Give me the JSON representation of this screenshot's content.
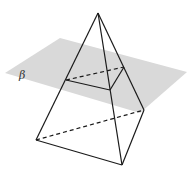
{
  "diagram": {
    "type": "geometry",
    "plane": {
      "label": "β",
      "color": "#d9d9d9",
      "polygon": [
        [
          5,
          73
        ],
        [
          60,
          38
        ],
        [
          187,
          72
        ],
        [
          140,
          113
        ]
      ],
      "label_pos": [
        19,
        79
      ]
    },
    "vertices": {
      "apex": [
        98,
        13
      ],
      "base_left": [
        36,
        140
      ],
      "base_front": [
        122,
        165
      ],
      "base_back": [
        144,
        110
      ],
      "cut_left": [
        66,
        80
      ],
      "cut_front": [
        110,
        90
      ],
      "cut_back": [
        124,
        67
      ]
    },
    "edges_solid": [
      [
        "apex",
        "base_left"
      ],
      [
        "apex",
        "base_front"
      ],
      [
        "apex",
        "base_back"
      ],
      [
        "base_left",
        "base_front"
      ],
      [
        "base_front",
        "base_back"
      ],
      [
        "cut_left",
        "cut_front"
      ],
      [
        "cut_front",
        "cut_back"
      ]
    ],
    "edges_dashed": [
      [
        "base_left",
        "base_back"
      ],
      [
        "cut_left",
        "cut_back"
      ]
    ],
    "line_color": "#1a1a1a"
  }
}
